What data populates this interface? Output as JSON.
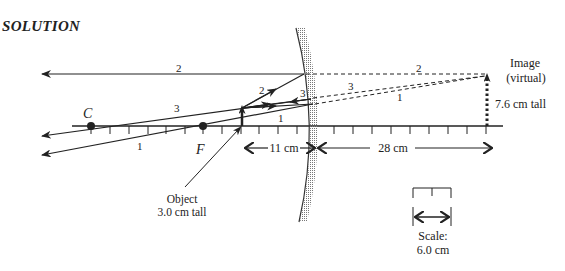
{
  "title": "SOLUTION",
  "diagram": {
    "type": "ray diagram - convex mirror",
    "points": {
      "center_label": "C",
      "focal_label": "F"
    },
    "rays": [
      {
        "id": "1",
        "label": "1"
      },
      {
        "id": "2",
        "label": "2"
      },
      {
        "id": "3",
        "label": "3"
      }
    ],
    "object": {
      "label_line1": "Object",
      "label_line2": "3.0 cm tall"
    },
    "image": {
      "label_line1": "Image",
      "label_line2": "(virtual)",
      "height_label": "7.6 cm tall"
    },
    "dimensions": {
      "object_distance": "11 cm",
      "image_distance": "28 cm"
    },
    "scale": {
      "label_line1": "Scale:",
      "label_line2": "6.0 cm"
    }
  }
}
